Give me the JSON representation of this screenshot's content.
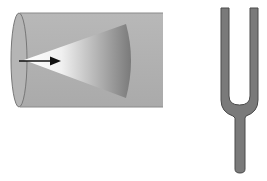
{
  "diagram": {
    "title": "",
    "elements": [
      {
        "id": "tube",
        "type": "cylinder",
        "description": "horizontal gray tube viewed from the side with an open elliptical end on the left"
      },
      {
        "id": "wave-cone",
        "type": "cone",
        "description": "spreading wavefront cone shaded from white at apex to dark gray at curved front"
      },
      {
        "id": "direction-arrow",
        "type": "arrow",
        "description": "black arrow pointing right indicating propagation direction"
      },
      {
        "id": "tuning-fork",
        "type": "object",
        "description": "gray tuning fork with two prongs and a handle"
      }
    ],
    "colors": {
      "tube_fill": "#b0b0b0",
      "tube_edge": "#808080",
      "cone_light": "#ffffff",
      "cone_dark": "#777777",
      "arrow": "#111111",
      "fork_fill": "#7a7a7a",
      "fork_edge": "#4a4a4a"
    }
  }
}
